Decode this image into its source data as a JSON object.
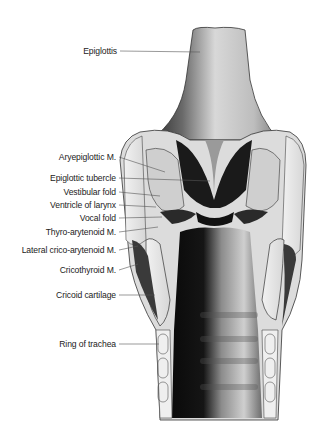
{
  "diagram": {
    "colors": {
      "background": "#ffffff",
      "ink": "#1a1a1a",
      "leader": "#555555",
      "cartilage": "#e8e8e8"
    },
    "labels": [
      {
        "id": "epiglottis",
        "text": "Epiglottis",
        "x": 117,
        "y": 46,
        "lx1": 120,
        "ly1": 51,
        "lx2": 200,
        "ly2": 52
      },
      {
        "id": "aryepiglottic-m",
        "text": "Aryepiglottic M.",
        "x": 116,
        "y": 152,
        "lx1": 119,
        "ly1": 157,
        "lx2": 165,
        "ly2": 172
      },
      {
        "id": "epiglottic-tubercle",
        "text": "Epiglottic tubercle",
        "x": 116,
        "y": 173,
        "lx1": 119,
        "ly1": 178,
        "lx2": 210,
        "ly2": 181
      },
      {
        "id": "vestibular-fold",
        "text": "Vestibular fold",
        "x": 116,
        "y": 187,
        "lx1": 119,
        "ly1": 192,
        "lx2": 160,
        "ly2": 196
      },
      {
        "id": "ventricle-of-larynx",
        "text": "Ventricle of larynx",
        "x": 116,
        "y": 200,
        "lx1": 119,
        "ly1": 205,
        "lx2": 156,
        "ly2": 207
      },
      {
        "id": "vocal-fold",
        "text": "Vocal fold",
        "x": 116,
        "y": 213,
        "lx1": 119,
        "ly1": 218,
        "lx2": 162,
        "ly2": 217
      },
      {
        "id": "thyro-arytenoid-m",
        "text": "Thyro-arytenoid M.",
        "x": 116,
        "y": 227,
        "lx1": 119,
        "ly1": 232,
        "lx2": 158,
        "ly2": 227
      },
      {
        "id": "lateral-crico-arytenoid-m",
        "text": "Lateral crico-arytenoid M.",
        "x": 116,
        "y": 245,
        "lx1": 119,
        "ly1": 250,
        "lx2": 138,
        "ly2": 246
      },
      {
        "id": "cricothyroid-m",
        "text": "Cricothyroid M.",
        "x": 116,
        "y": 265,
        "lx1": 119,
        "ly1": 270,
        "lx2": 138,
        "ly2": 264
      },
      {
        "id": "cricoid-cartilage",
        "text": "Cricoid cartilage",
        "x": 116,
        "y": 290,
        "lx1": 119,
        "ly1": 295,
        "lx2": 155,
        "ly2": 295
      },
      {
        "id": "ring-of-trachea",
        "text": "Ring of trachea",
        "x": 116,
        "y": 339,
        "lx1": 119,
        "ly1": 344,
        "lx2": 159,
        "ly2": 344
      }
    ]
  }
}
